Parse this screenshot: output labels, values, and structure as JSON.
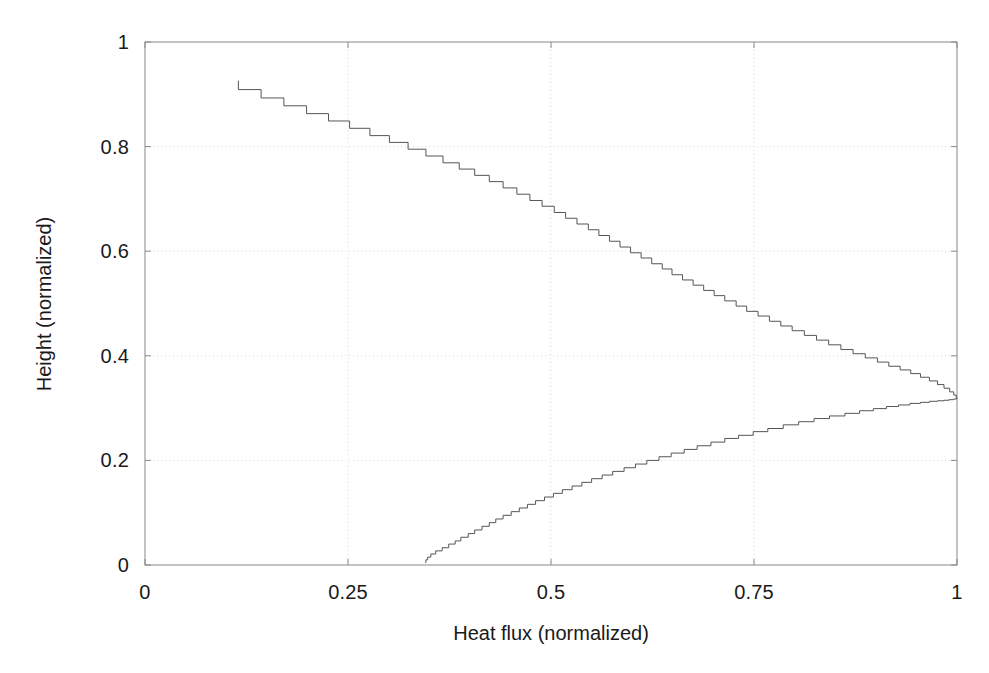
{
  "chart_data": {
    "type": "line",
    "title": "",
    "subtitle": "",
    "xlabel": "Heat flux (normalized)",
    "ylabel": "Height (normalized)",
    "xlim": [
      0,
      1
    ],
    "ylim": [
      0,
      1
    ],
    "xticks": [
      "0",
      "0.25",
      "0.5",
      "0.75",
      "1"
    ],
    "xtick_values": [
      0,
      0.25,
      0.5,
      0.75,
      1
    ],
    "yticks": [
      "0",
      "0.2",
      "0.4",
      "0.6",
      "0.8",
      "1"
    ],
    "ytick_values": [
      0,
      0.2,
      0.4,
      0.6,
      0.8,
      1
    ],
    "grid": true,
    "grid_style": "dotted",
    "grid_color": "#d8d8d8",
    "legend": null,
    "legend_position": "none",
    "line_color": "#555555",
    "line_width": 1,
    "frame_color": "#888888",
    "background": "#ffffff",
    "series": [
      {
        "name": "Heat flux profile",
        "orientation": "x-as-value, y-as-height",
        "drawstyle": "steps",
        "x": [
          0.345,
          0.346,
          0.348,
          0.352,
          0.358,
          0.366,
          0.374,
          0.382,
          0.389,
          0.398,
          0.406,
          0.415,
          0.424,
          0.432,
          0.441,
          0.451,
          0.461,
          0.471,
          0.481,
          0.492,
          0.503,
          0.514,
          0.526,
          0.538,
          0.55,
          0.563,
          0.576,
          0.59,
          0.604,
          0.618,
          0.633,
          0.648,
          0.664,
          0.68,
          0.697,
          0.714,
          0.731,
          0.749,
          0.767,
          0.786,
          0.805,
          0.824,
          0.843,
          0.862,
          0.88,
          0.897,
          0.913,
          0.928,
          0.942,
          0.955,
          0.966,
          0.976,
          0.984,
          0.99,
          0.995,
          0.998,
          1.0,
          0.999,
          0.996,
          0.991,
          0.984,
          0.976,
          0.966,
          0.955,
          0.943,
          0.93,
          0.916,
          0.902,
          0.887,
          0.872,
          0.857,
          0.842,
          0.827,
          0.812,
          0.797,
          0.783,
          0.769,
          0.755,
          0.741,
          0.728,
          0.714,
          0.701,
          0.688,
          0.675,
          0.662,
          0.649,
          0.637,
          0.624,
          0.611,
          0.598,
          0.585,
          0.572,
          0.559,
          0.546,
          0.532,
          0.518,
          0.504,
          0.489,
          0.474,
          0.458,
          0.441,
          0.424,
          0.406,
          0.387,
          0.367,
          0.346,
          0.324,
          0.301,
          0.277,
          0.252,
          0.226,
          0.199,
          0.171,
          0.143,
          0.115
        ],
        "y": [
          0.005,
          0.01,
          0.015,
          0.021,
          0.027,
          0.033,
          0.04,
          0.046,
          0.053,
          0.06,
          0.067,
          0.074,
          0.081,
          0.088,
          0.095,
          0.102,
          0.109,
          0.116,
          0.123,
          0.13,
          0.137,
          0.144,
          0.151,
          0.158,
          0.165,
          0.172,
          0.179,
          0.186,
          0.193,
          0.2,
          0.207,
          0.214,
          0.221,
          0.228,
          0.235,
          0.242,
          0.248,
          0.255,
          0.261,
          0.268,
          0.274,
          0.28,
          0.285,
          0.29,
          0.295,
          0.299,
          0.303,
          0.306,
          0.309,
          0.311,
          0.313,
          0.314,
          0.315,
          0.316,
          0.317,
          0.318,
          0.32,
          0.325,
          0.331,
          0.338,
          0.345,
          0.352,
          0.359,
          0.366,
          0.373,
          0.38,
          0.388,
          0.396,
          0.404,
          0.412,
          0.421,
          0.43,
          0.439,
          0.448,
          0.457,
          0.466,
          0.476,
          0.485,
          0.495,
          0.505,
          0.515,
          0.525,
          0.535,
          0.545,
          0.555,
          0.566,
          0.576,
          0.587,
          0.597,
          0.608,
          0.619,
          0.63,
          0.641,
          0.652,
          0.663,
          0.674,
          0.686,
          0.697,
          0.709,
          0.721,
          0.733,
          0.745,
          0.757,
          0.769,
          0.782,
          0.795,
          0.808,
          0.821,
          0.835,
          0.849,
          0.863,
          0.878,
          0.893,
          0.909,
          0.926
        ],
        "peak": {
          "x": 1.0,
          "y": 0.3
        },
        "start": {
          "x": 0.345,
          "y": 0.005
        },
        "end": {
          "x": 0.115,
          "y": 1.0
        }
      }
    ]
  }
}
